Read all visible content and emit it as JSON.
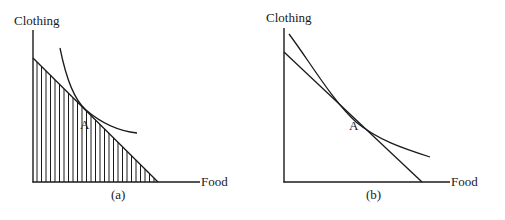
{
  "panels": [
    {
      "id": "a",
      "caption": "(a)",
      "y_axis_label": "Clothing",
      "x_axis_label": "Food",
      "point_label": "A",
      "budget_set_shaded": true,
      "shading": "vertical-hatch"
    },
    {
      "id": "b",
      "caption": "(b)",
      "y_axis_label": "Clothing",
      "x_axis_label": "Food",
      "point_label": "A",
      "budget_set_shaded": false
    }
  ],
  "colors": {
    "ink": "#1a1a1a",
    "background": "#ffffff"
  }
}
